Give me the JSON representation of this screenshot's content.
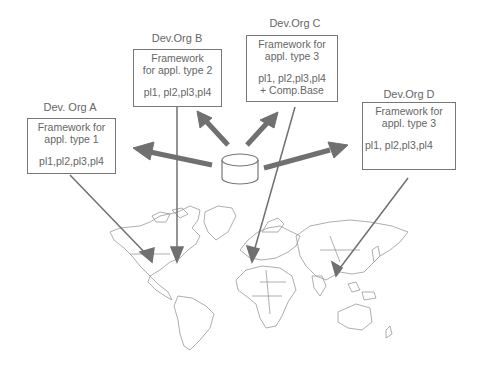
{
  "diagram": {
    "orgs": [
      {
        "id": "A",
        "name": "Dev. Org A",
        "framework": "Framework for",
        "type": "appl. type 1",
        "products": "pl1,pl2,pl3,pl4",
        "extra": ""
      },
      {
        "id": "B",
        "name": "Dev.Org B",
        "framework": "Framework",
        "type": "for appl. type 2",
        "products": "pl1, pl2,pl3,pl4",
        "extra": ""
      },
      {
        "id": "C",
        "name": "Dev.Org C",
        "framework": "Framework for",
        "type": "appl. type 3",
        "products": "pl1, pl2,pl3,pl4",
        "extra": "+ Comp.Base"
      },
      {
        "id": "D",
        "name": "Dev.Org D",
        "framework": "Framework for",
        "type": "appl. type 3",
        "products": "pl1, pl2,pl3,pl4",
        "extra": ""
      }
    ],
    "center": {
      "icon": "database-cylinder-icon"
    },
    "background": {
      "icon": "world-map"
    },
    "colors": {
      "arrow": "#707070",
      "line": "#777777",
      "text": "#666666"
    }
  }
}
